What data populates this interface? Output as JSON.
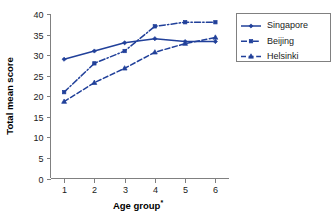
{
  "chart_data": {
    "type": "line",
    "title": "",
    "xlabel": "Age group",
    "xlabel_superscript": "*",
    "ylabel": "Total mean score",
    "categories": [
      "1",
      "2",
      "3",
      "4",
      "5",
      "6"
    ],
    "x": [
      1,
      2,
      3,
      4,
      5,
      6
    ],
    "ylim": [
      0,
      40
    ],
    "yticks": [
      "0",
      "5",
      "10",
      "15",
      "20",
      "25",
      "30",
      "35",
      "40"
    ],
    "ytick_values": [
      0,
      5,
      10,
      15,
      20,
      25,
      30,
      35,
      40
    ],
    "xticks": [
      "1",
      "2",
      "3",
      "4",
      "5",
      "6"
    ],
    "grid": false,
    "legend_position": "right",
    "series": [
      {
        "name": "Singapore",
        "values": [
          29,
          31,
          33,
          34,
          33.3,
          33.3
        ],
        "color": "#21409A",
        "linestyle": "solid",
        "marker": "diamond"
      },
      {
        "name": "Beijing",
        "values": [
          21,
          28,
          31,
          37,
          38,
          38
        ],
        "color": "#21409A",
        "linestyle": "dashdot",
        "marker": "square"
      },
      {
        "name": "Helsinki",
        "values": [
          18.7,
          23.3,
          26.8,
          30.7,
          32.8,
          34.3
        ],
        "color": "#21409A",
        "linestyle": "dashed",
        "marker": "triangle"
      }
    ]
  },
  "legend": {
    "items": [
      {
        "label": "Singapore"
      },
      {
        "label": "Beijing"
      },
      {
        "label": "Helsinki"
      }
    ]
  },
  "colors": {
    "series": "#21409A",
    "axis": "#808080",
    "text": "#1a1a1a",
    "background": "#ffffff"
  }
}
